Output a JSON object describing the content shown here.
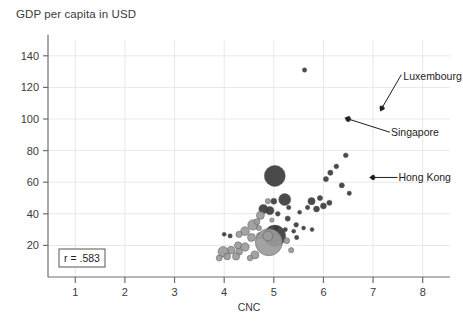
{
  "chart_data": {
    "type": "scatter",
    "title": "GDP per capita in USD",
    "xlabel": "CNC",
    "ylabel": "",
    "xlim": [
      0.45,
      8.55
    ],
    "ylim": [
      0,
      150
    ],
    "xticks": [
      1,
      2,
      3,
      4,
      5,
      6,
      7,
      8
    ],
    "xtick_labels": [
      "1",
      "2",
      "3",
      "4",
      "5",
      "6",
      "7",
      "8"
    ],
    "yticks": [
      20,
      40,
      60,
      80,
      100,
      120,
      140
    ],
    "ytick_labels": [
      "20",
      "40",
      "60",
      "80",
      "100",
      "120",
      "140"
    ],
    "grid": true,
    "legend": "none",
    "correlation_label": "r = .583",
    "annotations": [
      {
        "label": "Luxembourg",
        "x": 7.18,
        "y": 107,
        "label_x": 7.55,
        "label_y": 127
      },
      {
        "label": "Singapore",
        "x": 6.5,
        "y": 100,
        "label_x": 7.3,
        "label_y": 92
      },
      {
        "label": "Hong Kong",
        "x": 7.0,
        "y": 63,
        "label_x": 7.45,
        "label_y": 63
      }
    ],
    "series": [
      {
        "name": "countries",
        "points": [
          {
            "x": 5.62,
            "y": 131,
            "r": 2.2,
            "c": "dark"
          },
          {
            "x": 7.18,
            "y": 107,
            "r": 2.2,
            "c": "dark"
          },
          {
            "x": 6.5,
            "y": 100,
            "r": 2.6,
            "c": "dark"
          },
          {
            "x": 7.0,
            "y": 63,
            "r": 2.2,
            "c": "dark"
          },
          {
            "x": 6.45,
            "y": 77,
            "r": 2.4,
            "c": "dark"
          },
          {
            "x": 6.26,
            "y": 70,
            "r": 2.4,
            "c": "dark"
          },
          {
            "x": 6.14,
            "y": 66,
            "r": 2.6,
            "c": "dark"
          },
          {
            "x": 6.05,
            "y": 62,
            "r": 2.6,
            "c": "dark"
          },
          {
            "x": 6.37,
            "y": 58,
            "r": 2.6,
            "c": "dark"
          },
          {
            "x": 6.52,
            "y": 53,
            "r": 2.2,
            "c": "dark"
          },
          {
            "x": 5.02,
            "y": 64,
            "r": 10.5,
            "c": "dark"
          },
          {
            "x": 5.22,
            "y": 49,
            "r": 6.0,
            "c": "dark"
          },
          {
            "x": 5.0,
            "y": 48,
            "r": 3.0,
            "c": "dark"
          },
          {
            "x": 4.88,
            "y": 48,
            "r": 2.6,
            "c": "light"
          },
          {
            "x": 5.76,
            "y": 48,
            "r": 3.6,
            "c": "dark"
          },
          {
            "x": 5.93,
            "y": 50,
            "r": 2.6,
            "c": "dark"
          },
          {
            "x": 6.0,
            "y": 45,
            "r": 3.0,
            "c": "dark"
          },
          {
            "x": 6.12,
            "y": 47,
            "r": 2.6,
            "c": "dark"
          },
          {
            "x": 5.86,
            "y": 43,
            "r": 3.0,
            "c": "dark"
          },
          {
            "x": 5.68,
            "y": 44,
            "r": 2.2,
            "c": "dark"
          },
          {
            "x": 4.79,
            "y": 43,
            "r": 4.6,
            "c": "dark"
          },
          {
            "x": 4.92,
            "y": 42,
            "r": 4.2,
            "c": "dark"
          },
          {
            "x": 4.73,
            "y": 39,
            "r": 4.0,
            "c": "light"
          },
          {
            "x": 5.08,
            "y": 40,
            "r": 2.4,
            "c": "dark"
          },
          {
            "x": 5.28,
            "y": 37,
            "r": 2.6,
            "c": "dark"
          },
          {
            "x": 5.45,
            "y": 33,
            "r": 2.4,
            "c": "dark"
          },
          {
            "x": 5.6,
            "y": 31,
            "r": 2.0,
            "c": "dark"
          },
          {
            "x": 5.77,
            "y": 30,
            "r": 2.0,
            "c": "dark"
          },
          {
            "x": 5.4,
            "y": 29,
            "r": 2.0,
            "c": "dark"
          },
          {
            "x": 5.23,
            "y": 30,
            "r": 2.2,
            "c": "dark"
          },
          {
            "x": 5.05,
            "y": 31,
            "r": 2.4,
            "c": "dark"
          },
          {
            "x": 4.58,
            "y": 33,
            "r": 5.2,
            "c": "light"
          },
          {
            "x": 4.66,
            "y": 35,
            "r": 3.0,
            "c": "light"
          },
          {
            "x": 4.42,
            "y": 29,
            "r": 4.4,
            "c": "light"
          },
          {
            "x": 4.3,
            "y": 27,
            "r": 3.2,
            "c": "light"
          },
          {
            "x": 4.12,
            "y": 26,
            "r": 2.2,
            "c": "dark"
          },
          {
            "x": 4.55,
            "y": 25,
            "r": 4.0,
            "c": "light"
          },
          {
            "x": 4.72,
            "y": 26,
            "r": 3.4,
            "c": "light"
          },
          {
            "x": 4.86,
            "y": 28,
            "r": 3.0,
            "c": "dark"
          },
          {
            "x": 5.02,
            "y": 26,
            "r": 10.8,
            "c": "dark"
          },
          {
            "x": 4.9,
            "y": 22,
            "r": 13.5,
            "c": "light"
          },
          {
            "x": 4.88,
            "y": 26,
            "r": 5.0,
            "c": "light"
          },
          {
            "x": 5.26,
            "y": 23,
            "r": 3.0,
            "c": "light"
          },
          {
            "x": 5.35,
            "y": 17,
            "r": 2.6,
            "c": "light"
          },
          {
            "x": 4.28,
            "y": 20,
            "r": 3.6,
            "c": "light"
          },
          {
            "x": 4.42,
            "y": 19,
            "r": 4.2,
            "c": "light"
          },
          {
            "x": 4.14,
            "y": 17,
            "r": 3.8,
            "c": "light"
          },
          {
            "x": 4.3,
            "y": 16,
            "r": 3.4,
            "c": "light"
          },
          {
            "x": 3.98,
            "y": 16,
            "r": 5.2,
            "c": "light"
          },
          {
            "x": 4.06,
            "y": 13,
            "r": 3.4,
            "c": "light"
          },
          {
            "x": 4.24,
            "y": 13,
            "r": 3.6,
            "c": "light"
          },
          {
            "x": 3.9,
            "y": 12,
            "r": 3.0,
            "c": "light"
          },
          {
            "x": 4.62,
            "y": 14,
            "r": 4.0,
            "c": "light"
          },
          {
            "x": 4.52,
            "y": 12,
            "r": 2.8,
            "c": "light"
          },
          {
            "x": 4.0,
            "y": 27,
            "r": 2.0,
            "c": "dark"
          },
          {
            "x": 5.46,
            "y": 25,
            "r": 2.2,
            "c": "dark"
          },
          {
            "x": 5.52,
            "y": 41,
            "r": 2.0,
            "c": "dark"
          },
          {
            "x": 5.3,
            "y": 44,
            "r": 2.2,
            "c": "dark"
          },
          {
            "x": 4.96,
            "y": 36,
            "r": 2.2,
            "c": "light"
          },
          {
            "x": 4.7,
            "y": 31,
            "r": 2.6,
            "c": "light"
          }
        ]
      }
    ],
    "colors": {
      "dark_bubble": "#3b3b3b",
      "light_bubble": "#9a9a9a",
      "axis": "#6e6e6e",
      "grid": "#e8e8e8"
    }
  }
}
